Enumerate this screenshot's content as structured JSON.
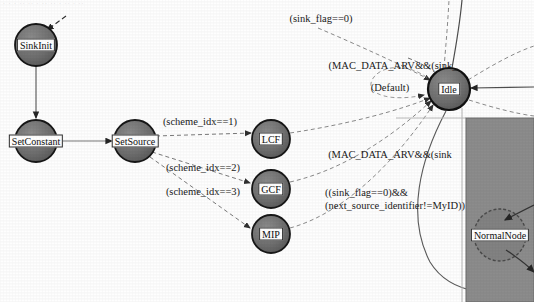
{
  "diagram": {
    "kind": "statechart",
    "background": "#fefefe",
    "header_artifact": "· · ·   ·· ·· · ·· ·· · ·· · ··",
    "colors": {
      "node_fill": "#6d6d6d",
      "node_fill_light": "#7d7d7d",
      "node_stroke": "#1b1b1b",
      "edge_solid": "#3a3a3a",
      "edge_dashed": "#6f6f6f",
      "label_text": "#101010",
      "panel_fill": "#8c8c8c",
      "panel_stroke": "#5a5a5a"
    },
    "nodes": [
      {
        "id": "sinkinit",
        "label": "SinkInit",
        "cx": 36,
        "cy": 45,
        "r": 21
      },
      {
        "id": "setconstant",
        "label": "SetConstant",
        "cx": 36,
        "cy": 141,
        "r": 21
      },
      {
        "id": "setsource",
        "label": "SetSource",
        "cx": 135,
        "cy": 141,
        "r": 21
      },
      {
        "id": "lcf",
        "label": "LCF",
        "cx": 271,
        "cy": 139,
        "r": 19
      },
      {
        "id": "gcf",
        "label": "GCF",
        "cx": 271,
        "cy": 189,
        "r": 19
      },
      {
        "id": "mip",
        "label": "MIP",
        "cx": 271,
        "cy": 234,
        "r": 19
      },
      {
        "id": "idle",
        "label": "Idle",
        "cx": 449,
        "cy": 89,
        "r": 21
      },
      {
        "id": "normalnode",
        "label": "NormalNode",
        "cx": 500,
        "cy": 235,
        "r": 26
      }
    ],
    "edge_labels": [
      {
        "id": "sink-flag-0",
        "text": "(sink_flag==0)",
        "x": 321,
        "y": 19
      },
      {
        "id": "mac-arv-top",
        "text": "(MAC_DATA_ARV&&(sink_",
        "x": 393,
        "y": 66
      },
      {
        "id": "default",
        "text": "(Default)",
        "x": 390,
        "y": 88
      },
      {
        "id": "scheme-idx-1",
        "text": "(scheme_idx==1)",
        "x": 200,
        "y": 122
      },
      {
        "id": "scheme-idx-2",
        "text": "(scheme_idx==2)",
        "x": 203,
        "y": 168
      },
      {
        "id": "scheme-idx-3",
        "text": "(scheme_idx==3)",
        "x": 203,
        "y": 192
      },
      {
        "id": "mac-arv-bottom",
        "text": "(MAC_DATA_ARV&&(sink",
        "x": 390,
        "y": 155
      },
      {
        "id": "sink-flag-myid",
        "text": "((sink_flag==0)&&",
        "x": 357,
        "y": 193
      },
      {
        "id": "sink-flag-myid2",
        "text": "(next_source_identifier!=MyID))",
        "x": 389,
        "y": 206
      }
    ],
    "panel": {
      "id": "normal-node-panel",
      "x": 466,
      "y": 118,
      "width": 68,
      "height": 184
    }
  }
}
